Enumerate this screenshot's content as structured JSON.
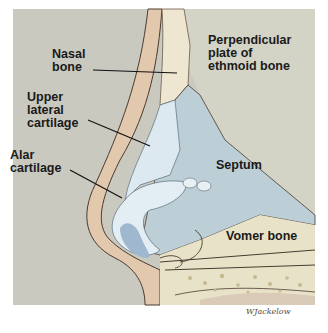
{
  "diagram": {
    "labels": [
      {
        "id": "nasal-bone",
        "text": "Nasal\nbone"
      },
      {
        "id": "perpendicular-plate",
        "text": "Perpendicular\nplate of\nethmoid bone"
      },
      {
        "id": "upper-lateral-cartilage",
        "text": "Upper\nlateral\ncartilage"
      },
      {
        "id": "alar-cartilage",
        "text": "Alar\ncartilage"
      },
      {
        "id": "septum",
        "text": "Septum"
      },
      {
        "id": "vomer-bone",
        "text": "Vomer bone"
      }
    ],
    "signature": "WJackelow",
    "colors": {
      "background": "#c9c9c0",
      "skin": "#e2c9ad",
      "cartilage": "#d6e6ef",
      "septum": "#bccfd6",
      "bone": "#e8e3c8",
      "outline": "#4a3a30"
    }
  }
}
